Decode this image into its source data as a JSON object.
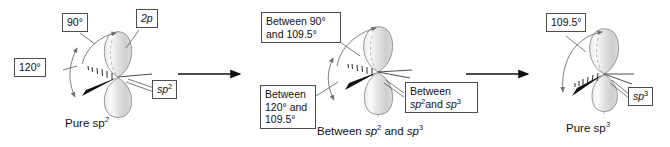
{
  "figure": {
    "type": "chemistry-diagram"
  },
  "panels": [
    {
      "id": "left",
      "caption": "Pure sp2",
      "caption_base": "Pure sp",
      "caption_sup": "2",
      "callouts": [
        {
          "name": "angle-90",
          "text": "90°"
        },
        {
          "name": "orbital-2p",
          "base": "2p",
          "sup": ""
        },
        {
          "name": "angle-120",
          "text": "120°"
        },
        {
          "name": "orbital-sp2",
          "base": "sp",
          "sup": "2"
        }
      ]
    },
    {
      "id": "middle",
      "caption_parts": {
        "a": "Between ",
        "b": "sp",
        "b_sup": "2",
        "c": " and ",
        "d": "sp",
        "d_sup": "3"
      },
      "caption_plain": "Between sp2 and sp3",
      "callouts": [
        {
          "name": "angle-between-90-109",
          "line1": "Between 90°",
          "line2": "and 109.5°"
        },
        {
          "name": "angle-between-120-109",
          "line1": "Between",
          "line2": "120° and",
          "line3": "109.5°"
        },
        {
          "name": "orbital-between-sp2-sp3",
          "line1": "Between",
          "b": "sp",
          "b_sup": "2",
          "mid": "and ",
          "d": "sp",
          "d_sup": "3"
        }
      ]
    },
    {
      "id": "right",
      "caption": "Pure sp3",
      "caption_base": "Pure sp",
      "caption_sup": "3",
      "callouts": [
        {
          "name": "angle-109-5",
          "text": "109.5°"
        },
        {
          "name": "orbital-sp3",
          "base": "sp",
          "sup": "3"
        }
      ]
    }
  ],
  "arrows": [
    {
      "name": "transition-arrow-1"
    },
    {
      "name": "transition-arrow-2"
    }
  ],
  "colors": {
    "background": "#ffffff",
    "lobe_fill_light": "#f2f2f2",
    "lobe_fill_mid": "#d5d5d5",
    "lobe_stroke": "#8c8c8c",
    "text": "#111111",
    "callout_border": "#4d4d4d",
    "wedge": "#111111",
    "arrow": "#111111"
  },
  "labels": {
    "angle_90": "90°",
    "angle_120": "120°",
    "angle_109_5": "109.5°",
    "p_orbital": "2p",
    "sp2": "sp2",
    "sp3": "sp3",
    "between_90_109_l1": "Between 90°",
    "between_90_109_l2": "and 109.5°",
    "between_120_109_l1": "Between",
    "between_120_109_l2": "120° and",
    "between_120_109_l3": "109.5°",
    "between_sp_l1": "Between",
    "pure_sp2": "Pure sp2",
    "pure_sp3": "Pure sp3",
    "between_sp2_sp3": "Between sp2 and sp3"
  }
}
